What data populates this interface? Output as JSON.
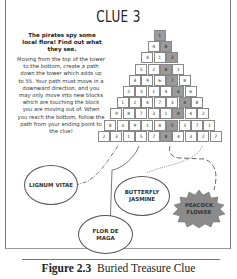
{
  "title": "CLUE 3",
  "intro": "The pirates spy some local flora! Find out what they see.",
  "instructions": "Moving from the top of the tower to the bottom, create a path down the tower which adds up to 55. Your path must move in a downward direction, and you may only move into new blocks which are touching the block you are moving out of. When you reach the bottom, follow the path from your ending point to the clue!",
  "pyramid": {
    "rows": [
      [
        1
      ],
      [
        4,
        8
      ],
      [
        4,
        1,
        3
      ],
      [
        5,
        2,
        8,
        1
      ],
      [
        4,
        9,
        6,
        7,
        8
      ],
      [
        2,
        3,
        1,
        4,
        6,
        6
      ],
      [
        1,
        2,
        4,
        7,
        3,
        4,
        8
      ],
      [
        9,
        8,
        7,
        3,
        1,
        8,
        4,
        2
      ],
      [
        8,
        3,
        9,
        1,
        8,
        5,
        3,
        7,
        1
      ],
      [
        2,
        3,
        1,
        5,
        7,
        8,
        4,
        3,
        2,
        7
      ]
    ],
    "shaded_index": [
      0,
      1,
      2,
      2,
      3,
      4,
      5,
      5,
      5,
      5
    ]
  },
  "flowers": {
    "lignum_vitae": "LIGNUM VITAE",
    "butterfly_jasmine": "BUTTERFLY JASMINE",
    "flor_de_maga": "FLOR DE MAGA",
    "peacock_flower": "PEACOCK FLOWER"
  },
  "caption": {
    "label": "Figure 2.3",
    "text": "Buried Treasure Clue"
  }
}
